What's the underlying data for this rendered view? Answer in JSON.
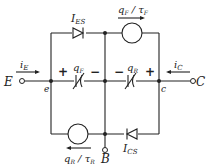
{
  "diagram": {
    "terminals": {
      "emitter": "E",
      "collector": "C",
      "base": "B"
    },
    "nodes": {
      "emitter_internal": "e",
      "collector_internal": "c"
    },
    "currents": {
      "emitter": "i",
      "emitter_sub": "E",
      "collector": "i",
      "collector_sub": "C"
    },
    "diodes": {
      "top": {
        "label": "I",
        "sub": "ES"
      },
      "bottom": {
        "label": "I",
        "sub": "CS"
      }
    },
    "sources": {
      "top": {
        "num": "q",
        "num_sub": "F",
        "den": "τ",
        "den_sub": "F"
      },
      "bottom": {
        "num": "q",
        "num_sub": "R",
        "den": "τ",
        "den_sub": "R"
      }
    },
    "capacitors": {
      "left": {
        "label": "q",
        "sub": "F",
        "plus": "+",
        "minus": "−"
      },
      "right": {
        "label": "q",
        "sub": "R",
        "plus": "+",
        "minus": "−"
      }
    }
  }
}
